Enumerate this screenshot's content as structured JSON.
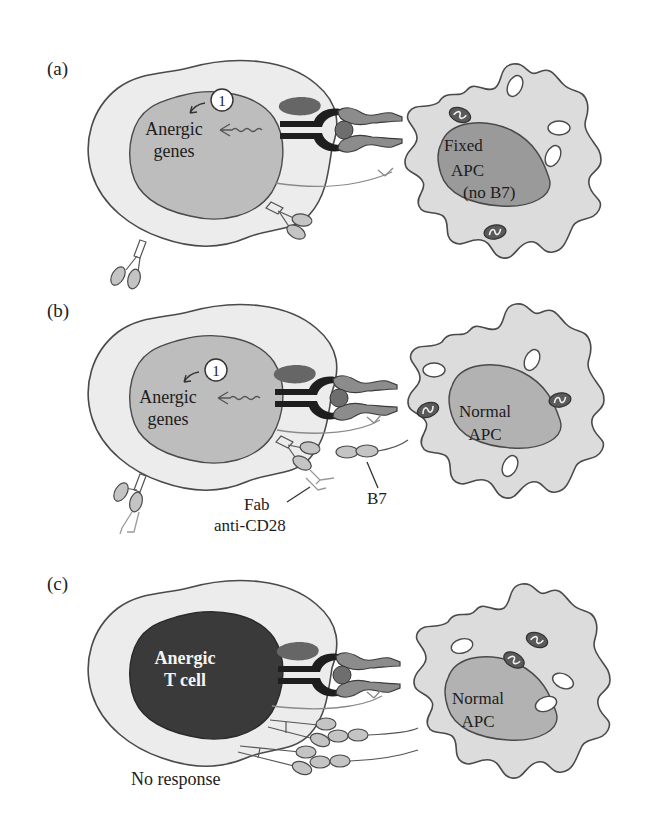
{
  "figure": {
    "colors": {
      "cell_membrane_fill": "#ececec",
      "nucleus_fill": "#bdbdbd",
      "anergic_nucleus_fill": "#3a3a3a",
      "apc_fill": "#dcdcdc",
      "tcr_color": "#1e1e1e",
      "mhc_color": "#8c8c8c"
    }
  },
  "panels": [
    {
      "label": "(a)",
      "tcell": {
        "nucleus_line1": "Anergic",
        "nucleus_line2": "genes",
        "step_number": "1"
      },
      "apc": {
        "line1": "Fixed",
        "line2": "APC",
        "line3": "(no B7)"
      }
    },
    {
      "label": "(b)",
      "tcell": {
        "nucleus_line1": "Anergic",
        "nucleus_line2": "genes",
        "step_number": "1"
      },
      "apc": {
        "line1": "Normal",
        "line2": "APC"
      },
      "annotations": {
        "fab_line1": "Fab",
        "fab_line2": "anti-CD28",
        "b7": "B7"
      }
    },
    {
      "label": "(c)",
      "tcell": {
        "nucleus_line1": "Anergic",
        "nucleus_line2": "T cell"
      },
      "apc": {
        "line1": "Normal",
        "line2": "APC"
      },
      "caption": "No response"
    }
  ]
}
